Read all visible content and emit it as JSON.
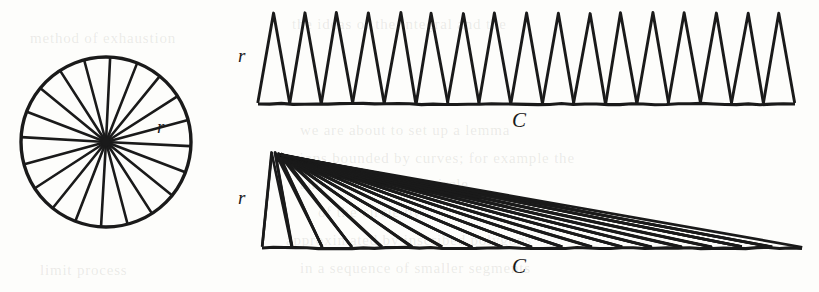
{
  "figure": {
    "background_color": "#fdfdfb",
    "ink_color": "#1a1a1a"
  },
  "labels": {
    "circle_radius": "r",
    "strip_radius": "r",
    "strip_circumference": "C",
    "fan_radius": "r",
    "fan_circumference": "C"
  },
  "chart_data": {
    "type": "diagram",
    "panels": [
      {
        "name": "sectored-circle",
        "shape": "circle",
        "center": [
          106,
          142
        ],
        "radius": 85,
        "sector_count": 20,
        "sector_angle_degrees": 18,
        "annotations": [
          {
            "text": "r",
            "x": 157,
            "y": 117,
            "meaning": "radius"
          }
        ]
      },
      {
        "name": "alternating-triangle-strip",
        "shape": "triangle-row",
        "triangle_count": 17,
        "apex_y": 13,
        "base_y": 103,
        "x_start": 258,
        "x_end": 795,
        "triangle_base_width": 31.6,
        "triangle_height": 90,
        "annotations": [
          {
            "text": "r",
            "x": 238,
            "y": 46,
            "meaning": "radius = triangle height"
          },
          {
            "text": "C",
            "x": 512,
            "y": 110,
            "meaning": "circumference = total base length"
          }
        ]
      },
      {
        "name": "sheared-triangle-fan",
        "shape": "triangle-fan",
        "triangle_count": 18,
        "apex": [
          272,
          152
        ],
        "base_y": 247,
        "x_start": 262,
        "x_end": 802,
        "annotations": [
          {
            "text": "r",
            "x": 238,
            "y": 188,
            "meaning": "radius = fan height"
          },
          {
            "text": "C",
            "x": 512,
            "y": 256,
            "meaning": "circumference = total base length"
          }
        ]
      }
    ],
    "relationship": "Area of disk = 1/2 * C * r",
    "xlabel": "",
    "ylabel": "",
    "grid": false,
    "legend": "none"
  },
  "page_bleed": [
    {
      "text": "the ideas of the integral and the",
      "x": 292,
      "y": 16
    },
    {
      "text": "we are about to set up a lemma",
      "x": 300,
      "y": 122
    },
    {
      "text": "regions bounded by curves; for example the",
      "x": 278,
      "y": 150
    },
    {
      "text": "and the radius of a circle",
      "x": 300,
      "y": 176
    },
    {
      "text": "of the circle by",
      "x": 318,
      "y": 204
    },
    {
      "text": "approximated by inscribed polygons",
      "x": 286,
      "y": 232
    },
    {
      "text": "in a sequence of smaller segments",
      "x": 300,
      "y": 260
    },
    {
      "text": "method of exhaustion",
      "x": 30,
      "y": 30
    },
    {
      "text": "limit process",
      "x": 40,
      "y": 262
    }
  ]
}
